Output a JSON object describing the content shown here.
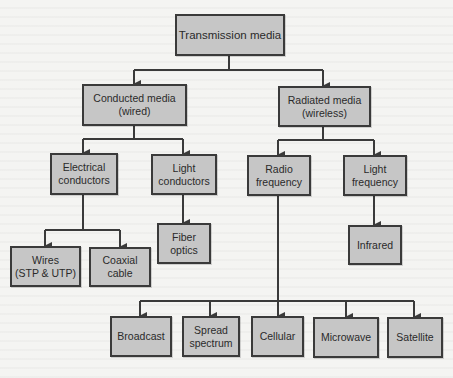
{
  "diagram": {
    "type": "hierarchy",
    "colors": {
      "node_fill": "#c6c6c6",
      "node_border": "#3a3a3a",
      "connector": "#3a3a3a",
      "background": "#f4f4f2"
    },
    "nodes": {
      "root": {
        "label": "Transmission media",
        "children": [
          "conducted",
          "radiated"
        ]
      },
      "conducted": {
        "label": "Conducted media\n(wired)",
        "children": [
          "electrical",
          "light_conductors"
        ]
      },
      "radiated": {
        "label": "Radiated media\n(wireless)",
        "children": [
          "radio",
          "light_frequency"
        ]
      },
      "electrical": {
        "label": "Electrical\nconductors",
        "children": [
          "wires",
          "coaxial"
        ]
      },
      "light_conductors": {
        "label": "Light\nconductors",
        "children": [
          "fiber"
        ]
      },
      "radio": {
        "label": "Radio\nfrequency",
        "children": [
          "broadcast",
          "spread",
          "cellular",
          "microwave",
          "satellite"
        ]
      },
      "light_frequency": {
        "label": "Light\nfrequency",
        "children": [
          "infrared"
        ]
      },
      "wires": {
        "label": "Wires\n(STP & UTP)"
      },
      "coaxial": {
        "label": "Coaxial\ncable"
      },
      "fiber": {
        "label": "Fiber\noptics"
      },
      "infrared": {
        "label": "Infrared"
      },
      "broadcast": {
        "label": "Broadcast"
      },
      "spread": {
        "label": "Spread\nspectrum"
      },
      "cellular": {
        "label": "Cellular"
      },
      "microwave": {
        "label": "Microwave"
      },
      "satellite": {
        "label": "Satellite"
      }
    }
  }
}
